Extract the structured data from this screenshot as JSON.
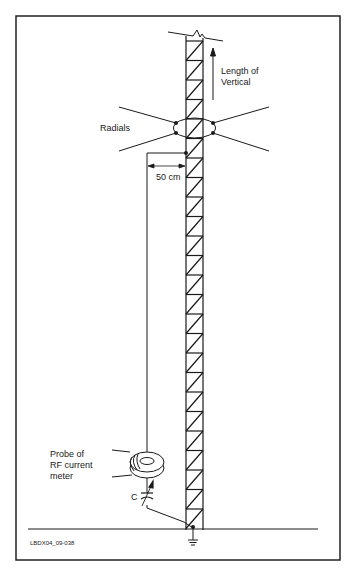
{
  "diagram": {
    "labels": {
      "length_line1": "Length of",
      "length_line2": "Vertical",
      "radials": "Radials",
      "distance": "50 cm",
      "probe_line1": "Probe of",
      "probe_line2": "RF current",
      "probe_line3": "meter",
      "capacitor": "C",
      "figure_id": "LBDX04_09-038"
    },
    "colors": {
      "stroke": "#1a1a1a",
      "background": "#ffffff",
      "frame": "#222222"
    }
  }
}
